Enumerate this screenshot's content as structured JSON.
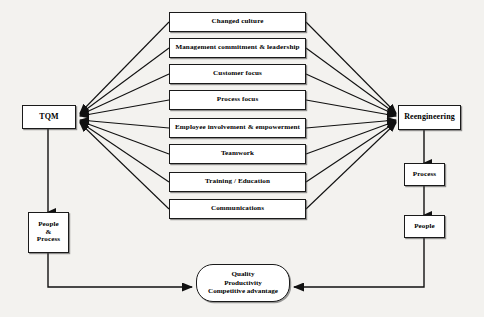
{
  "diagram": {
    "left_node": {
      "label": "TQM"
    },
    "right_node": {
      "label": "Reengineering"
    },
    "left_chain": [
      {
        "label": "People\n&\nProcess",
        "line1": "People",
        "line2": "&",
        "line3": "Process"
      }
    ],
    "right_chain": [
      {
        "label": "Process"
      },
      {
        "label": "People"
      }
    ],
    "factors": [
      {
        "label": "Changed culture"
      },
      {
        "label": "Management commitment & leadership"
      },
      {
        "label": "Customer focus"
      },
      {
        "label": "Process focus"
      },
      {
        "label": "Employee involvement & empowerment"
      },
      {
        "label": "Teamwork"
      },
      {
        "label": "Training / Education"
      },
      {
        "label": "Communications"
      }
    ],
    "outcome": {
      "line1": "Quality",
      "line2": "Productivity",
      "line3": "Competitive advantage"
    },
    "colors": {
      "background": "#f3f2ef",
      "node_fill": "#ffffff",
      "stroke": "#111111",
      "text": "#000000"
    }
  }
}
